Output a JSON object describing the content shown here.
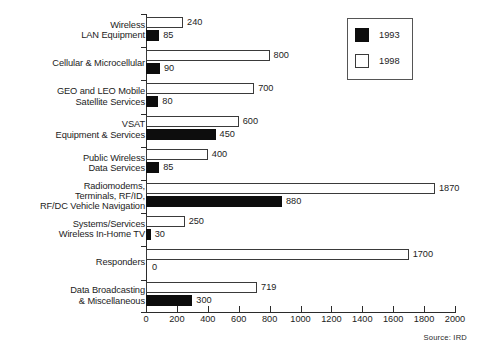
{
  "chart_data": {
    "type": "bar",
    "orientation": "horizontal",
    "title": "",
    "xlabel": "",
    "ylabel": "",
    "xlim": [
      0,
      2000
    ],
    "xticks": [
      0,
      200,
      400,
      600,
      800,
      1000,
      1200,
      1400,
      1600,
      1800,
      2000
    ],
    "grid": false,
    "legend_position": "top-right",
    "categories": [
      "Wireless\nLAN Equipment",
      "Cellular & Microcellular",
      "GEO and LEO Mobile\nSatellite Services",
      "VSAT\nEquipment & Services",
      "Public Wireless\nData Services",
      "Radiomodems,\nTerminals, RF/ID,\nRF/DC Vehicle Navigation",
      "Systems/Services\nWireless In-Home TV",
      "Responders",
      "Data Broadcasting\n& Miscellaneous"
    ],
    "series": [
      {
        "name": "1998",
        "color": "#ffffff",
        "values": [
          240,
          800,
          700,
          600,
          400,
          1870,
          250,
          1700,
          719
        ]
      },
      {
        "name": "1993",
        "color": "#000000",
        "values": [
          85,
          90,
          80,
          450,
          85,
          880,
          30,
          0,
          300
        ]
      }
    ],
    "source": "Source:  IRD"
  },
  "legend": {
    "entries": [
      {
        "label": "1993",
        "swatch": "black"
      },
      {
        "label": "1998",
        "swatch": "white"
      }
    ]
  },
  "axis": {
    "tick_labels": [
      "0",
      "200",
      "400",
      "600",
      "800",
      "1000",
      "1200",
      "1400",
      "1600",
      "1800",
      "2000"
    ]
  },
  "footer": {
    "source": "Source:  IRD"
  }
}
